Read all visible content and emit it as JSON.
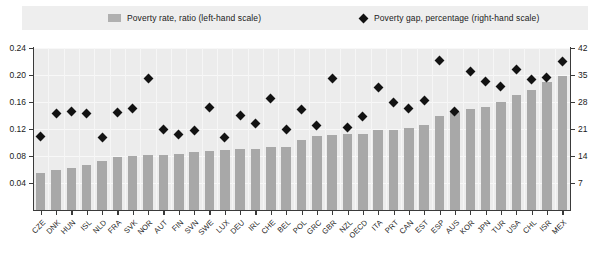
{
  "legend": {
    "bar_label": "Poverty rate, ratio (left-hand scale)",
    "marker_label": "Poverty gap, percentage (right-hand scale)",
    "bar_color": "#b0b0b0",
    "marker_color": "#111111",
    "background": "#eeeeee"
  },
  "chart_data": {
    "type": "bar",
    "title": "",
    "xlabel": "",
    "ylabel": "",
    "grid": true,
    "legend_position": "top",
    "categories": [
      "CZE",
      "DNK",
      "HUN",
      "ISL",
      "NLD",
      "FRA",
      "SVK",
      "NOR",
      "AUT",
      "FIN",
      "SVN",
      "SWE",
      "LUX",
      "DEU",
      "IRL",
      "CHE",
      "BEL",
      "POL",
      "GRC",
      "GBR",
      "NZL",
      "OECD",
      "ITA",
      "PRT",
      "CAN",
      "EST",
      "ESP",
      "AUS",
      "KOR",
      "JPN",
      "TUR",
      "USA",
      "CHL",
      "ISR",
      "MEX"
    ],
    "left_axis": {
      "label": "Poverty rate, ratio",
      "ticks": [
        "0.04",
        "0.08",
        "0.12",
        "0.16",
        "0.20",
        "0.24"
      ],
      "tick_values": [
        0.04,
        0.08,
        0.12,
        0.16,
        0.2,
        0.24
      ],
      "ylim": [
        0,
        0.24
      ]
    },
    "right_axis": {
      "label": "Poverty gap, percentage",
      "ticks": [
        "7",
        "14",
        "21",
        "28",
        "35",
        "42"
      ],
      "tick_values": [
        7,
        14,
        21,
        28,
        35,
        42
      ],
      "ylim": [
        0,
        42
      ]
    },
    "series": [
      {
        "name": "Poverty rate, ratio (left-hand scale)",
        "type": "bar",
        "axis": "left",
        "color": "#a8a8a8",
        "values": [
          0.055,
          0.06,
          0.062,
          0.067,
          0.073,
          0.079,
          0.08,
          0.081,
          0.082,
          0.083,
          0.086,
          0.088,
          0.089,
          0.09,
          0.091,
          0.093,
          0.094,
          0.104,
          0.11,
          0.111,
          0.112,
          0.113,
          0.118,
          0.119,
          0.122,
          0.126,
          0.14,
          0.145,
          0.149,
          0.152,
          0.16,
          0.17,
          0.178,
          0.189,
          0.199
        ]
      },
      {
        "name": "Poverty gap, percentage (right-hand scale)",
        "type": "scatter",
        "axis": "right",
        "color": "#121212",
        "values": [
          19.0,
          25.0,
          25.6,
          25.0,
          18.7,
          25.4,
          26.2,
          34.0,
          20.8,
          19.5,
          20.7,
          26.5,
          18.9,
          24.6,
          22.5,
          29.0,
          20.8,
          26.0,
          21.9,
          34.0,
          21.3,
          24.3,
          31.8,
          27.8,
          26.4,
          28.5,
          38.8,
          25.5,
          35.8,
          33.3,
          32.0,
          36.5,
          33.8,
          34.3,
          38.5
        ]
      }
    ]
  }
}
